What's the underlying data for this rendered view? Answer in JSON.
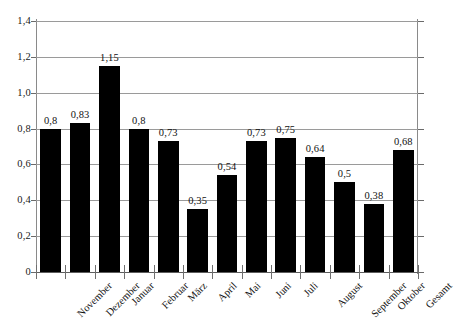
{
  "chart_data": {
    "type": "bar",
    "title": "",
    "subtitle": "",
    "xlabel": "",
    "ylabel": "",
    "categories": [
      "November",
      "Dezember",
      "Januar",
      "Februar",
      "März",
      "April",
      "Mai",
      "Juni",
      "Juli",
      "August",
      "September",
      "Oktober",
      "Gesamt"
    ],
    "values": [
      0.8,
      0.83,
      1.15,
      0.8,
      0.73,
      0.35,
      0.54,
      0.73,
      0.75,
      0.64,
      0.5,
      0.38,
      0.68
    ],
    "value_labels": [
      "0,8",
      "0,83",
      "1,15",
      "0,8",
      "0,73",
      "0,35",
      "0,54",
      "0,73",
      "0,75",
      "0,64",
      "0,5",
      "0,38",
      "0,68"
    ],
    "ylim": [
      0,
      1.4
    ],
    "ytick_values": [
      0,
      0.2,
      0.4,
      0.6,
      0.8,
      1.0,
      1.2,
      1.4
    ],
    "ytick_labels": [
      "0",
      "0,2",
      "0,4",
      "0,6",
      "0,8",
      "1,0",
      "1,2",
      "1,4"
    ],
    "grid": true,
    "grid_axis": "y",
    "legend": false,
    "legend_entries": [],
    "bar_color": "#000000",
    "grid_color": "#9a9a9a",
    "axis_color": "#8a8a8a",
    "background_color": "#ffffff",
    "decimal_separator": ",",
    "xtick_label_rotation": -45,
    "annotations": []
  }
}
